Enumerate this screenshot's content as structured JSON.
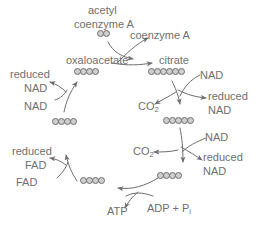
{
  "diagram": {
    "colors": {
      "text": "#6f6f6f",
      "stroke": "#6d6d6d",
      "carbon_fill": "#cfcfcf",
      "background": "#ffffff"
    },
    "labels": {
      "acetyl": "acetyl",
      "coenzyme_a_in": "coenzyme A",
      "coenzyme_a_out": "coenzyme A",
      "oxaloacetate": "oxaloacetate",
      "citrate": "citrate",
      "nad_1": "NAD",
      "reduced_nad_1": "reduced",
      "nad_1b": "NAD",
      "co2_1": "CO",
      "co2_1_sub": "2",
      "nad_2": "NAD",
      "reduced_nad_2": "reduced",
      "nad_2b": "NAD",
      "co2_2": "CO",
      "co2_2_sub": "2",
      "atp": "ATP",
      "adp_pi": "ADP + P",
      "adp_pi_sub": "i",
      "fad": "FAD",
      "reduced_fad": "reduced",
      "reduced_fad_b": "FAD",
      "nad_3_reduced": "reduced",
      "nad_3_reduced_b": "NAD",
      "nad_3": "NAD"
    },
    "molecules": [
      {
        "name": "acetyl-coenzyme-a",
        "carbons": 2
      },
      {
        "name": "oxaloacetate",
        "carbons": 4
      },
      {
        "name": "citrate",
        "carbons": 6
      },
      {
        "name": "five-carbon-intermediate",
        "carbons": 5
      },
      {
        "name": "four-carbon-intermediate-right",
        "carbons": 4
      },
      {
        "name": "four-carbon-intermediate-bottom",
        "carbons": 4
      },
      {
        "name": "four-carbon-intermediate-left",
        "carbons": 4
      }
    ]
  }
}
